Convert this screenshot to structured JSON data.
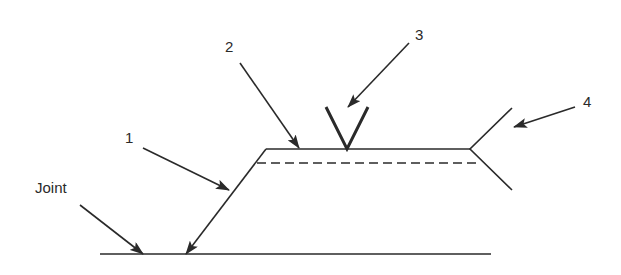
{
  "diagram": {
    "colors": {
      "ink": "#2a2a2a",
      "background": "#ffffff"
    },
    "labels": {
      "joint": "Joint",
      "one": "1",
      "two": "2",
      "three": "3",
      "four": "4"
    },
    "callouts": [
      {
        "id": "1",
        "target": "arrow-line"
      },
      {
        "id": "2",
        "target": "reference-line"
      },
      {
        "id": "3",
        "target": "weld-symbol"
      },
      {
        "id": "4",
        "target": "tail"
      },
      {
        "id": "Joint",
        "target": "joint"
      }
    ]
  }
}
